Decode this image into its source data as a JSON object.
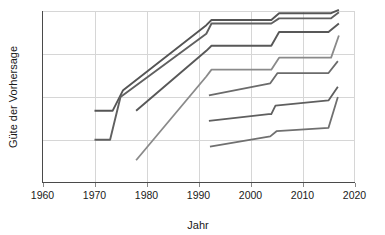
{
  "chart_data": {
    "type": "line",
    "title": "",
    "subtitle": "",
    "xlabel": "Jahr",
    "ylabel": "Güte der Vorhersage",
    "xlim": [
      1960,
      2020
    ],
    "ylim": [
      0,
      100
    ],
    "xticks": [
      1960,
      1970,
      1980,
      1990,
      2000,
      2010,
      2020
    ],
    "xticklabels": [
      "1960",
      "1970",
      "1980",
      "1990",
      "2000",
      "2010",
      "2020"
    ],
    "yticks": [],
    "yticklabels": [],
    "grid": "horizontal-and-vertical",
    "legend": "none",
    "annotations": [],
    "series": [
      {
        "name": "Serie 1",
        "color": "#555555",
        "width": 1.9,
        "x": [
          1970,
          1973.5,
          1975.5,
          1991.5,
          1992.5,
          2004.0,
          2005.5,
          2015.5,
          2017.0
        ],
        "y": [
          42,
          42,
          54,
          92,
          95,
          95,
          99,
          99,
          101
        ]
      },
      {
        "name": "Serie 2",
        "color": "#606060",
        "width": 1.9,
        "x": [
          1970,
          1973.0,
          1975.0,
          1991.5,
          1992.5,
          2004.0,
          2005.5,
          2015.5,
          2017.0
        ],
        "y": [
          25,
          25,
          50,
          87,
          93,
          93,
          96,
          96,
          99.5
        ]
      },
      {
        "name": "Serie 3",
        "color": "#585858",
        "width": 1.9,
        "x": [
          1978,
          1991.5,
          1992.5,
          2004.0,
          2005.5,
          2015.0,
          2017.0
        ],
        "y": [
          42,
          77,
          80,
          80,
          88,
          88,
          93
        ]
      },
      {
        "name": "Serie 4",
        "color": "#8a8a8a",
        "width": 1.8,
        "x": [
          1978,
          1991.5,
          1992.5,
          2004.0,
          2005.5,
          2015.5,
          2017.0
        ],
        "y": [
          13,
          62,
          66,
          66,
          73,
          73,
          86
        ]
      },
      {
        "name": "Serie 5",
        "color": "#6b6b6b",
        "width": 1.8,
        "x": [
          1992.0,
          2003.8,
          2005.2,
          2015.0,
          2016.8
        ],
        "y": [
          51,
          58,
          64,
          64,
          71
        ]
      },
      {
        "name": "Serie 6",
        "color": "#5f5f5f",
        "width": 1.8,
        "x": [
          1992.0,
          2003.5,
          2004.0,
          2004.8,
          2015.0,
          2016.8
        ],
        "y": [
          36,
          40,
          40,
          45,
          48,
          56
        ]
      },
      {
        "name": "Serie 7",
        "color": "#707070",
        "width": 1.8,
        "x": [
          1992.2,
          2003.8,
          2005.0,
          2015.0,
          2016.8
        ],
        "y": [
          21,
          27,
          30,
          32,
          50
        ]
      }
    ]
  },
  "axes": {
    "x_title": "Jahr",
    "y_title": "Güte der Vorhersage"
  },
  "ticks": {
    "x": [
      "1960",
      "1970",
      "1980",
      "1990",
      "2000",
      "2010",
      "2020"
    ]
  },
  "colors": {
    "grid": "#d6d6d6",
    "axis": "#4a4a4a",
    "text": "#1a1a1a",
    "background": "#ffffff"
  }
}
